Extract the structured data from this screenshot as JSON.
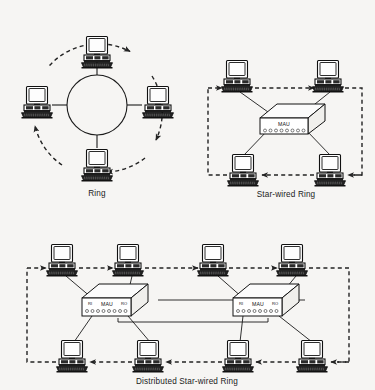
{
  "figure": {
    "background_color": "#f6f5f3",
    "ink_color": "#1a1a1a"
  },
  "panels": [
    {
      "id": "ring",
      "caption": "Ring",
      "topology_type": "ring",
      "node_count": 4,
      "hub_count": 0,
      "flow_direction": "clockwise",
      "flow_style": "dashed-circle-with-arrows",
      "ring_shape": "circle",
      "nodes": [
        {
          "name": "workstation-top",
          "x": 97,
          "y": 42
        },
        {
          "name": "workstation-right",
          "x": 158,
          "y": 105
        },
        {
          "name": "workstation-bottom",
          "x": 97,
          "y": 168
        },
        {
          "name": "workstation-left",
          "x": 37,
          "y": 105
        }
      ]
    },
    {
      "id": "star-wired-ring",
      "caption": "Star-wired Ring",
      "topology_type": "star-wired ring",
      "node_count": 4,
      "hub_count": 1,
      "flow_direction": "clockwise",
      "flow_style": "dashed-rectangle-with-arrows",
      "hubs": [
        {
          "name": "mau",
          "label": "MAU",
          "ports": 8,
          "x": 285,
          "y": 120
        }
      ],
      "nodes": [
        {
          "name": "workstation-top-left",
          "x": 237,
          "y": 79
        },
        {
          "name": "workstation-top-right",
          "x": 328,
          "y": 79
        },
        {
          "name": "workstation-bottom-left",
          "x": 243,
          "y": 166
        },
        {
          "name": "workstation-bottom-right",
          "x": 330,
          "y": 166
        }
      ]
    },
    {
      "id": "distributed-star-wired-ring",
      "caption": "Distributed Star-wired Ring",
      "topology_type": "distributed star-wired ring",
      "node_count": 8,
      "hub_count": 2,
      "flow_direction": "clockwise",
      "flow_style": "dashed-rectangle-with-arrows",
      "trunk_links": "RO of MAU 1 to RI of MAU 2",
      "hubs": [
        {
          "name": "mau-left",
          "label": "MAU",
          "port_in_label": "RI",
          "port_out_label": "RO",
          "ports": 8,
          "x": 115,
          "y": 305
        },
        {
          "name": "mau-right",
          "label": "MAU",
          "port_in_label": "RI",
          "port_out_label": "RO",
          "ports": 8,
          "x": 265,
          "y": 305
        }
      ],
      "nodes": [
        {
          "name": "workstation-top-1",
          "x": 62,
          "y": 262
        },
        {
          "name": "workstation-top-2",
          "x": 128,
          "y": 262
        },
        {
          "name": "workstation-top-3",
          "x": 213,
          "y": 262
        },
        {
          "name": "workstation-top-4",
          "x": 292,
          "y": 262
        },
        {
          "name": "workstation-bottom-1",
          "x": 72,
          "y": 355
        },
        {
          "name": "workstation-bottom-2",
          "x": 148,
          "y": 355
        },
        {
          "name": "workstation-bottom-3",
          "x": 238,
          "y": 355
        },
        {
          "name": "workstation-bottom-4",
          "x": 312,
          "y": 355
        }
      ]
    }
  ],
  "labels": {
    "ring_caption": "Ring",
    "star_wired_caption": "Star-wired Ring",
    "distributed_caption": "Distributed Star-wired Ring",
    "mau": "MAU",
    "ri": "RI",
    "ro": "RO"
  }
}
